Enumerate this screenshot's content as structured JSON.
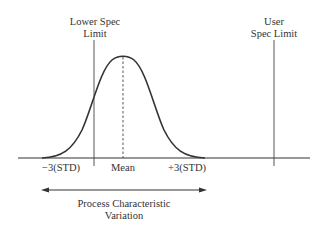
{
  "diagram": {
    "lower_spec_label_line1": "Lower Spec",
    "lower_spec_label_line2": "Limit",
    "user_spec_label_line1": "User",
    "user_spec_label_line2": "Spec Limit",
    "minus_3std_label": "−3(STD)",
    "mean_label": "Mean",
    "plus_3std_label": "+3(STD)",
    "variation_label_line1": "Process Characteristic",
    "variation_label_line2": "Variation",
    "colors": {
      "line": "#333333",
      "background": "#ffffff"
    }
  }
}
